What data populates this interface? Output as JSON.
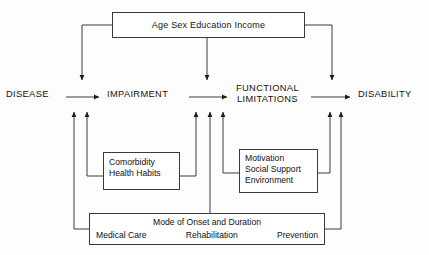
{
  "diagram": {
    "colors": {
      "line": "#3a3a3a",
      "text": "#111111",
      "background": "#fdfdfd"
    },
    "stages": [
      {
        "id": "disease",
        "label": "DISEASE"
      },
      {
        "id": "impairment",
        "label": "IMPAIRMENT"
      },
      {
        "id": "functional_limitations",
        "label": "FUNCTIONAL\nLIMITATIONS"
      },
      {
        "id": "disability",
        "label": "DISABILITY"
      }
    ],
    "boxes": {
      "demographics": {
        "id": "demographics",
        "line1": "Age   Sex   Education   Income",
        "items": [
          "Age",
          "Sex",
          "Education",
          "Income"
        ]
      },
      "comorbidity": {
        "id": "comorbidity",
        "lines": [
          "Comorbidity",
          "Health Habits"
        ]
      },
      "motivation": {
        "id": "motivation",
        "lines": [
          "Motivation",
          "Social Support",
          "Environment"
        ]
      },
      "bottom": {
        "id": "mode-of-onset",
        "heading": "Mode of Onset and Duration",
        "items": [
          "Medical Care",
          "Rehabilitation",
          "Prevention"
        ]
      }
    },
    "arrows": {
      "horizontal": [
        {
          "from": "disease",
          "to": "impairment"
        },
        {
          "from": "impairment",
          "to": "functional_limitations"
        },
        {
          "from": "functional_limitations",
          "to": "disability"
        }
      ],
      "from_demographics": [
        "impairment",
        "functional_limitations",
        "disability"
      ],
      "into_impairment": [
        "mode-of-onset",
        "comorbidity"
      ],
      "into_functional_limitations": [
        "comorbidity",
        "mode-of-onset",
        "motivation"
      ],
      "into_disability": [
        "motivation",
        "mode-of-onset"
      ]
    }
  }
}
